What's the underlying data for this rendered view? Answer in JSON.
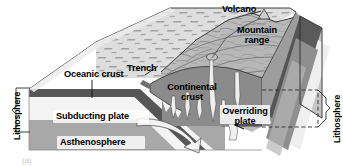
{
  "figure": {
    "type": "geological-block-diagram",
    "background_color": "#ffffff"
  },
  "labels": {
    "volcano": "Volcano",
    "mountain_range": "Mountain range",
    "trench": "Trench",
    "oceanic_crust": "Oceanic crust",
    "continental_crust": "Continental crust",
    "subducting_plate": "Subducting plate",
    "asthenosphere": "Asthenosphere",
    "overriding_plate": "Overriding plate",
    "lithosphere_left": "Lithosphere",
    "lithosphere_right": "Lithosphere"
  },
  "caption": {
    "mark": "(a)"
  },
  "colors": {
    "ocean_surface": "#d2d2d2",
    "ocean_surface_light": "#e4e4e4",
    "oceanic_crust_band": "#5a5a5a",
    "lithospheric_mantle": "#f2f2f2",
    "asthenosphere": "#a8a8a8",
    "continental_crust": "#8a8a8a",
    "mountain_surface": "#b9b9b9",
    "side_face_dark": "#4e4e4e",
    "magma": "#efefef",
    "outline": "#000000",
    "text": "#000000"
  },
  "annotations": {
    "subduction_arrow": "curved arrow showing descending slab",
    "overriding_arrow": "leftward arrow showing overriding plate motion",
    "lithosphere_bracket_left": "bracket spanning oceanic crust and lithospheric mantle",
    "lithosphere_bracket_right": "dashed bracket spanning continental lithosphere"
  }
}
